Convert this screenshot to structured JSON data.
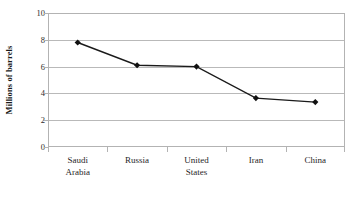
{
  "chart_data": {
    "type": "line",
    "title": "",
    "subtitle": "",
    "xlabel": "",
    "ylabel": "Millions of barrels",
    "categories": [
      "Saudi Arabia",
      "Russia",
      "United States",
      "Iran",
      "China"
    ],
    "values": [
      7.8,
      6.1,
      6.0,
      3.65,
      3.35
    ],
    "series": [
      {
        "name": "Millions of barrels",
        "values": [
          7.8,
          6.1,
          6.0,
          3.65,
          3.35
        ]
      }
    ],
    "ylim": [
      0,
      10
    ],
    "ytick_labels": [
      "10",
      "8",
      "6",
      "4",
      "2",
      "0"
    ],
    "ytick_values": [
      10,
      8,
      6,
      4,
      2,
      0
    ],
    "grid": true,
    "legend": "none",
    "marker": "diamond",
    "line_color": "#1a1a1a",
    "marker_color": "#111111",
    "grid_color": "#b9b9b9",
    "frame_color": "#b3b3b3",
    "background_color": "#ffffff"
  },
  "axis": {
    "y_title": "Millions of barrels"
  },
  "categories_display": [
    {
      "line1": "Saudi",
      "line2": "Arabia"
    },
    {
      "line1": "Russia",
      "line2": ""
    },
    {
      "line1": "United",
      "line2": "States"
    },
    {
      "line1": "Iran",
      "line2": ""
    },
    {
      "line1": "China",
      "line2": ""
    }
  ]
}
